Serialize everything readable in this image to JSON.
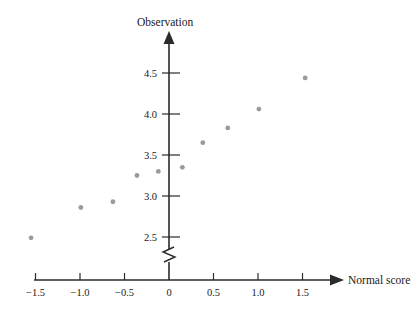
{
  "chart_data": {
    "type": "scatter",
    "title": "",
    "xlabel": "Normal score",
    "ylabel": "Observation",
    "xlim": [
      -1.85,
      1.95
    ],
    "ylim": [
      2.35,
      4.75
    ],
    "grid": false,
    "legend": null,
    "axis_break_y": true,
    "x_ticks": [
      -1.5,
      -1.0,
      -0.5,
      0,
      0.5,
      1.0,
      1.5
    ],
    "x_tick_labels": [
      "−1.5",
      "−1.0",
      "−0.5",
      "0",
      "0.5",
      "1.0",
      "1.5"
    ],
    "y_ticks": [
      2.5,
      3.0,
      3.5,
      4.0,
      4.5
    ],
    "y_tick_labels": [
      "2.5",
      "3.0",
      "3.5",
      "4.0",
      "4.5"
    ],
    "point_color": "#9a9a9a",
    "axis_color": "#2b2b2b",
    "points": [
      {
        "x": -1.55,
        "y": 2.49
      },
      {
        "x": -0.99,
        "y": 2.86
      },
      {
        "x": -0.63,
        "y": 2.93
      },
      {
        "x": -0.36,
        "y": 3.25
      },
      {
        "x": -0.12,
        "y": 3.3
      },
      {
        "x": 0.15,
        "y": 3.35
      },
      {
        "x": 0.38,
        "y": 3.65
      },
      {
        "x": 0.66,
        "y": 3.83
      },
      {
        "x": 1.01,
        "y": 4.06
      },
      {
        "x": 1.53,
        "y": 4.44
      }
    ],
    "series": [
      {
        "name": "observations",
        "x": [
          -1.55,
          -0.99,
          -0.63,
          -0.36,
          -0.12,
          0.15,
          0.38,
          0.66,
          1.01,
          1.53
        ],
        "values": [
          2.49,
          2.86,
          2.93,
          3.25,
          3.3,
          3.35,
          3.65,
          3.83,
          4.06,
          4.44
        ]
      }
    ]
  },
  "labels": {
    "y_axis_title": "Observation",
    "x_axis_title": "Normal score"
  }
}
